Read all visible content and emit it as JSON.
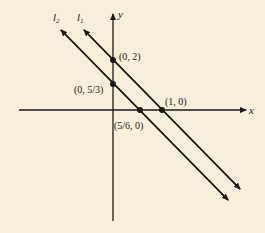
{
  "figure": {
    "background": "#f7efdc",
    "ink": "#1c1a17",
    "axes": {
      "x_label": "x",
      "y_label": "y"
    },
    "lines": [
      {
        "name": "l1",
        "label_main": "l",
        "label_sub": "1",
        "equation": "y = -2x + 2"
      },
      {
        "name": "l2",
        "label_main": "l",
        "label_sub": "2",
        "equation": "y = -2x + 5/3"
      }
    ],
    "points": [
      {
        "label": "(0, 2)",
        "x": 0,
        "y": 2,
        "line": "l1"
      },
      {
        "label": "(1, 0)",
        "x": 1,
        "y": 0,
        "line": "l1"
      },
      {
        "label": "(0, 5/3)",
        "x": 0,
        "y": 1.6667,
        "line": "l2"
      },
      {
        "label": "(5/6, 0)",
        "x": 0.8333,
        "y": 0,
        "line": "l2"
      }
    ]
  }
}
